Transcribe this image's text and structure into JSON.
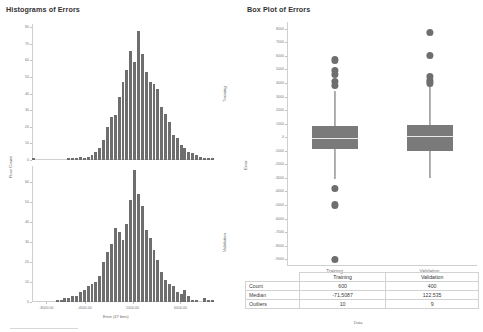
{
  "histograms": {
    "title": "Histograms of Errors",
    "y_axis_label": "Row Count",
    "x_axis_label": "Error (47 bins)",
    "panels": [
      {
        "name": "Training",
        "side_label": "Training",
        "yticks": [
          0,
          10,
          20,
          30,
          40,
          50,
          60,
          70,
          80
        ],
        "ylim": [
          0,
          82
        ],
        "xlim": [
          -9500,
          9500
        ],
        "counts": [
          1,
          0,
          0,
          0,
          0,
          0,
          0,
          0,
          0,
          1,
          1,
          1,
          2,
          1,
          2,
          3,
          5,
          7,
          12,
          20,
          26,
          27,
          38,
          47,
          54,
          66,
          59,
          78,
          64,
          53,
          47,
          46,
          43,
          32,
          28,
          23,
          15,
          13,
          9,
          7,
          5,
          4,
          3,
          2,
          1,
          1,
          1
        ]
      },
      {
        "name": "Validation",
        "side_label": "Validation",
        "yticks": [
          0,
          10,
          20,
          30,
          40,
          50,
          60
        ],
        "ylim": [
          0,
          68
        ],
        "xlim": [
          -9500,
          9500
        ],
        "counts": [
          0,
          0,
          0,
          0,
          0,
          0,
          1,
          1,
          2,
          2,
          3,
          3,
          5,
          6,
          8,
          9,
          10,
          13,
          20,
          25,
          29,
          37,
          35,
          31,
          39,
          51,
          66,
          54,
          48,
          36,
          32,
          26,
          21,
          15,
          11,
          9,
          8,
          5,
          4,
          6,
          3,
          1,
          1,
          0,
          2,
          1,
          1
        ]
      }
    ],
    "xticks": [
      {
        "value": -8000,
        "label": "-8000.00"
      },
      {
        "value": -4000,
        "label": "-4000.00"
      },
      {
        "value": 1000,
        "label": "1000.00"
      },
      {
        "value": 6000,
        "label": "6000.00"
      }
    ]
  },
  "boxplot": {
    "title": "Box Plot of Errors",
    "y_axis_label": "Error",
    "x_axis_label": "Data",
    "ylim": [
      -9500,
      8500
    ],
    "yticks": [
      8000,
      7000,
      6000,
      5000,
      4000,
      3000,
      2000,
      1000,
      0,
      -1000,
      -2000,
      -3000,
      -4000,
      -5000,
      -6000,
      -7000,
      -8000,
      -9000
    ],
    "groups": [
      {
        "label": "Training",
        "q1": -900,
        "q3": 800,
        "median": -71.5087,
        "whisker_low": -3100,
        "whisker_high": 3400,
        "outliers": [
          5700,
          4900,
          4600,
          4100,
          3800,
          -3800,
          -5000,
          -9000
        ]
      },
      {
        "label": "Validation",
        "q1": -1000,
        "q3": 900,
        "median": 122.535,
        "whisker_low": -3000,
        "whisker_high": 3900,
        "outliers": [
          7700,
          6000,
          4500,
          4200,
          4000
        ]
      }
    ]
  },
  "table": {
    "corner_label": "",
    "columns": [
      "Training",
      "Validation"
    ],
    "rows": [
      {
        "label": "Count",
        "values": [
          "600",
          "400"
        ]
      },
      {
        "label": "Median",
        "values": [
          "-71.5087",
          "122.535"
        ]
      },
      {
        "label": "Outliers",
        "values": [
          "10",
          "9"
        ]
      }
    ],
    "caption": "Data"
  },
  "colors": {
    "bar": "#6e6e6e",
    "box": "#7a7a7a",
    "axis": "#cfcfcf",
    "text": "#3c3c3c"
  }
}
